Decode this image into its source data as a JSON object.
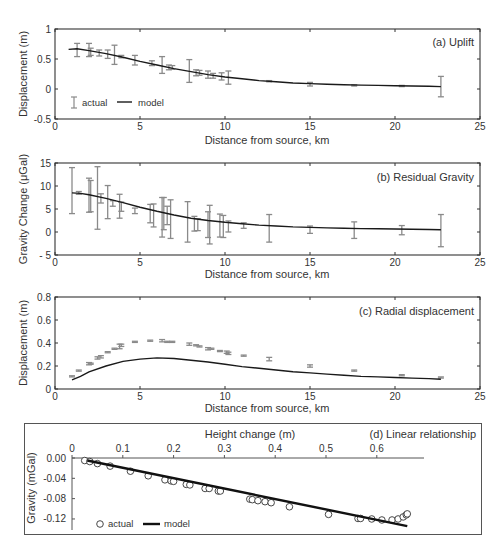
{
  "chart_data": [
    {
      "id": "a",
      "type": "line",
      "title": "(a) Uplift",
      "xlabel": "Distance from source, km",
      "ylabel": "Displacement (m)",
      "xlim": [
        0,
        25
      ],
      "ylim": [
        -0.5,
        1
      ],
      "xticks": [
        0,
        5,
        10,
        15,
        20,
        25
      ],
      "yticks": [
        -0.5,
        0,
        0.5,
        1
      ],
      "ytick_labels": [
        "-0.5",
        "0",
        "0.5",
        "1"
      ],
      "legend": [
        "actual",
        "model"
      ],
      "legend_position": "lower left",
      "series": [
        {
          "name": "actual",
          "kind": "errorbar",
          "x": [
            1.3,
            2.0,
            2.1,
            2.6,
            3.1,
            3.5,
            3.9,
            4.7,
            5.7,
            6.3,
            6.7,
            6.9,
            7.9,
            8.3,
            8.5,
            9.0,
            9.3,
            9.8,
            10.2,
            12.6,
            15.0,
            17.6,
            20.4,
            22.7
          ],
          "y": [
            0.65,
            0.65,
            0.62,
            0.6,
            0.58,
            0.57,
            0.54,
            0.48,
            0.43,
            0.4,
            0.36,
            0.36,
            0.3,
            0.27,
            0.27,
            0.24,
            0.22,
            0.21,
            0.19,
            0.13,
            0.08,
            0.06,
            0.05,
            0.04
          ],
          "err": [
            0.11,
            0.11,
            0.06,
            0.05,
            0.07,
            0.16,
            0.02,
            0.08,
            0.04,
            0.14,
            0.04,
            0.03,
            0.19,
            0.05,
            0.04,
            0.06,
            0.04,
            0.06,
            0.11,
            0.01,
            0.03,
            0.01,
            0.01,
            0.17
          ]
        },
        {
          "name": "model",
          "kind": "line",
          "x": [
            0.8,
            1.3,
            2,
            3,
            4,
            5,
            6,
            7,
            8,
            9,
            10,
            11,
            12,
            13,
            14,
            15,
            16,
            17,
            18,
            19,
            20,
            21,
            22,
            22.7
          ],
          "y": [
            0.66,
            0.67,
            0.64,
            0.59,
            0.53,
            0.46,
            0.4,
            0.34,
            0.29,
            0.24,
            0.2,
            0.17,
            0.14,
            0.12,
            0.1,
            0.09,
            0.08,
            0.07,
            0.065,
            0.06,
            0.055,
            0.05,
            0.045,
            0.04
          ]
        }
      ]
    },
    {
      "id": "b",
      "type": "line",
      "title": "(b) Residual Gravity",
      "xlabel": "Distance from source, km",
      "ylabel": "Gravity Change (μGal)",
      "xlim": [
        0,
        25
      ],
      "ylim": [
        -5,
        15
      ],
      "xticks": [
        0,
        5,
        10,
        15,
        20,
        25
      ],
      "yticks": [
        -5,
        0,
        5,
        10,
        15
      ],
      "ytick_labels": [
        "- 5",
        "0",
        "5",
        "10",
        "15"
      ],
      "series": [
        {
          "name": "actual",
          "kind": "errorbar",
          "x": [
            1.0,
            1.4,
            2.0,
            2.1,
            2.5,
            2.7,
            3.1,
            3.4,
            3.8,
            3.9,
            4.7,
            5.6,
            5.8,
            6.3,
            6.4,
            6.6,
            6.8,
            7.8,
            8.2,
            8.4,
            9.0,
            9.1,
            9.7,
            9.9,
            10.2,
            11.1,
            12.6,
            15.0,
            17.6,
            20.4,
            22.7
          ],
          "y": [
            9.0,
            8.5,
            8.0,
            7.8,
            7.4,
            7.3,
            6.5,
            6.2,
            5.6,
            5.5,
            4.6,
            4.0,
            3.6,
            3.2,
            4.0,
            3.6,
            2.8,
            2.2,
            1.8,
            1.6,
            1.6,
            1.6,
            1.4,
            1.2,
            1.2,
            1.4,
            0.8,
            0.5,
            0.4,
            0.4,
            0.3
          ],
          "err": [
            5.0,
            0.3,
            3.7,
            3.4,
            6.8,
            1.0,
            3.6,
            0.6,
            2.6,
            1.0,
            0.6,
            2.0,
            2.5,
            4.3,
            3.5,
            2.0,
            4.2,
            4.4,
            1.6,
            1.3,
            2.8,
            4.2,
            2.5,
            2.4,
            1.2,
            0.6,
            3.0,
            0.8,
            1.8,
            1.0,
            3.5
          ]
        },
        {
          "name": "model",
          "kind": "line",
          "x": [
            1.0,
            1.5,
            2,
            3,
            4,
            5,
            6,
            7,
            8,
            9,
            10,
            11,
            12,
            13,
            14,
            15,
            16,
            17,
            18,
            19,
            20,
            21,
            22,
            22.7
          ],
          "y": [
            8.5,
            8.4,
            8.1,
            7.3,
            6.4,
            5.4,
            4.5,
            3.7,
            3.0,
            2.5,
            2.1,
            1.8,
            1.5,
            1.3,
            1.1,
            1.0,
            0.9,
            0.8,
            0.75,
            0.7,
            0.65,
            0.6,
            0.55,
            0.5
          ]
        }
      ]
    },
    {
      "id": "c",
      "type": "line",
      "title": "(c) Radial displacement",
      "xlabel": "Distance from source, km",
      "ylabel": "Displacement (m)",
      "xlim": [
        0,
        25
      ],
      "ylim": [
        0,
        0.8
      ],
      "xticks": [
        0,
        5,
        10,
        15,
        20,
        25
      ],
      "yticks": [
        0,
        0.2,
        0.4,
        0.6,
        0.8
      ],
      "ytick_labels": [
        "0",
        "0.2",
        "0.4",
        "0.6",
        "0.8"
      ],
      "series": [
        {
          "name": "actual",
          "kind": "errorbar",
          "x": [
            1.0,
            1.4,
            2.0,
            2.1,
            2.5,
            2.7,
            3.1,
            3.5,
            3.8,
            3.9,
            4.7,
            5.6,
            6.3,
            6.6,
            6.9,
            7.9,
            8.3,
            8.5,
            9.0,
            9.2,
            9.7,
            10.1,
            10.2,
            11.1,
            12.6,
            15.0,
            17.6,
            20.4,
            22.7
          ],
          "y": [
            0.11,
            0.16,
            0.22,
            0.22,
            0.27,
            0.28,
            0.32,
            0.35,
            0.37,
            0.38,
            0.41,
            0.42,
            0.42,
            0.41,
            0.41,
            0.39,
            0.38,
            0.37,
            0.35,
            0.35,
            0.33,
            0.32,
            0.31,
            0.29,
            0.26,
            0.2,
            0.16,
            0.12,
            0.1
          ],
          "err": [
            0.005,
            0.005,
            0.01,
            0.005,
            0.01,
            0.01,
            0.005,
            0.005,
            0.02,
            0.01,
            0.005,
            0.005,
            0.01,
            0.005,
            0.005,
            0.01,
            0.005,
            0.005,
            0.01,
            0.005,
            0.005,
            0.01,
            0.01,
            0.005,
            0.015,
            0.01,
            0.005,
            0.005,
            0.005
          ]
        },
        {
          "name": "model",
          "kind": "line",
          "x": [
            1.0,
            1.5,
            2,
            3,
            4,
            5,
            6,
            7,
            8,
            9,
            10,
            11,
            12,
            13,
            14,
            15,
            16,
            17,
            18,
            19,
            20,
            21,
            22,
            22.7
          ],
          "y": [
            0.08,
            0.11,
            0.15,
            0.2,
            0.24,
            0.26,
            0.27,
            0.265,
            0.25,
            0.235,
            0.215,
            0.195,
            0.18,
            0.165,
            0.15,
            0.14,
            0.13,
            0.12,
            0.11,
            0.105,
            0.1,
            0.095,
            0.09,
            0.085
          ]
        }
      ]
    },
    {
      "id": "d",
      "type": "scatter",
      "title": "(d) Linear relationship",
      "xlabel": "Height change (m)",
      "ylabel": "Gravity (mGal)",
      "xlim": [
        0,
        0.7
      ],
      "ylim": [
        -0.14,
        0.0
      ],
      "xticks": [
        0,
        0.1,
        0.2,
        0.3,
        0.4,
        0.5,
        0.6
      ],
      "xtick_labels": [
        "0",
        "0.1",
        "0.2",
        "0.3",
        "0.4",
        "0.5",
        "0.6"
      ],
      "yticks": [
        0.0,
        -0.04,
        -0.08,
        -0.12
      ],
      "ytick_labels": [
        "0.00",
        "-0.04",
        "-0.08",
        "-0.12"
      ],
      "x_axis_position": "top",
      "legend": [
        "actual",
        "model"
      ],
      "legend_position": "lower left",
      "series": [
        {
          "name": "actual",
          "kind": "scatter",
          "x": [
            0.025,
            0.035,
            0.05,
            0.075,
            0.115,
            0.15,
            0.183,
            0.195,
            0.2,
            0.225,
            0.232,
            0.262,
            0.27,
            0.288,
            0.292,
            0.35,
            0.355,
            0.366,
            0.38,
            0.392,
            0.428,
            0.505,
            0.563,
            0.568,
            0.59,
            0.61,
            0.63,
            0.642,
            0.652,
            0.658,
            0.66
          ],
          "y": [
            -0.005,
            -0.007,
            -0.011,
            -0.016,
            -0.026,
            -0.035,
            -0.043,
            -0.045,
            -0.046,
            -0.052,
            -0.053,
            -0.06,
            -0.06,
            -0.065,
            -0.065,
            -0.081,
            -0.082,
            -0.084,
            -0.086,
            -0.088,
            -0.096,
            -0.111,
            -0.119,
            -0.119,
            -0.12,
            -0.122,
            -0.122,
            -0.12,
            -0.116,
            -0.112,
            -0.11
          ]
        },
        {
          "name": "model",
          "kind": "line",
          "x": [
            0.03,
            0.66
          ],
          "y": [
            -0.005,
            -0.134
          ]
        }
      ]
    }
  ],
  "panels": {
    "a": {
      "title": "(a) Uplift",
      "xlabel": "Distance from source, km",
      "ylabel": "Displacement (m)",
      "legend_actual": "actual",
      "legend_model": "model"
    },
    "b": {
      "title": "(b) Residual Gravity",
      "xlabel": "Distance from source, km",
      "ylabel": "Gravity Change (μGal)"
    },
    "c": {
      "title": "(c) Radial displacement",
      "xlabel": "Distance from source, km",
      "ylabel": "Displacement (m)"
    },
    "d": {
      "title": "(d) Linear relationship",
      "xlabel": "Height change (m)",
      "ylabel": "Gravity (mGal)",
      "legend_actual": "actual",
      "legend_model": "model"
    }
  },
  "colors": {
    "data": "#8a8a8a",
    "model": "#1a1a1a",
    "axis": "#333333"
  }
}
